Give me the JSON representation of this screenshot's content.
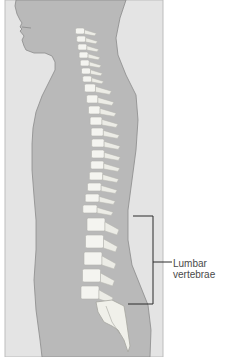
{
  "figure": {
    "colors": {
      "background_panel": "#e4e4e4",
      "body": "#b9b9b9",
      "body_outline": "#8a8a8a",
      "bone": "#f4f4f0",
      "bone_shadow": "#d2d2cc",
      "bracket": "#2a2a2a"
    }
  },
  "annotation": {
    "label_line1": "Lumbar",
    "label_line2": "vertebrae",
    "target": "lumbar-vertebrae"
  }
}
